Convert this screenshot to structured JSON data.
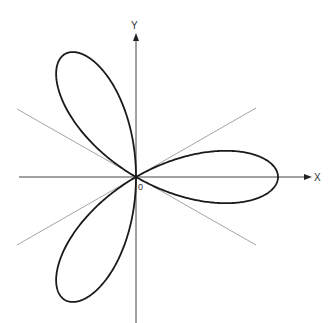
{
  "figure": {
    "type": "polar-curve",
    "labels": {
      "x_axis": "X",
      "y_axis": "Y",
      "origin": "0"
    },
    "geometry": {
      "origin": [
        136,
        177
      ],
      "petal_length_px": 142,
      "petals": 3,
      "petal_angles_deg": [
        0,
        120,
        240
      ],
      "guide_line_angles_deg": [
        30,
        -30
      ]
    },
    "colors": {
      "curve": "#1a1a1a",
      "axes": "#333333",
      "guide_lines": "#999999",
      "background": "#ffffff"
    }
  }
}
